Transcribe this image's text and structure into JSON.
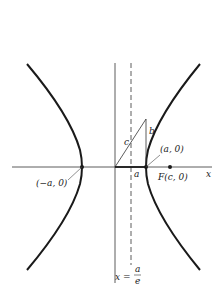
{
  "diagram": {
    "type": "hyperbola-with-directrix",
    "axis_labels": {
      "x": "x"
    },
    "points": {
      "left_vertex": "(−a, 0)",
      "right_vertex": "(a, 0)",
      "focus": "F(c, 0)"
    },
    "triangle_labels": {
      "hypotenuse": "c",
      "vertical_side": "b",
      "base": "a"
    },
    "directrix": {
      "lhs": "x =",
      "numerator": "a",
      "denominator": "e"
    },
    "colors": {
      "curve": "#1a1a1a",
      "axis": "#333333",
      "background": "#ffffff"
    }
  }
}
